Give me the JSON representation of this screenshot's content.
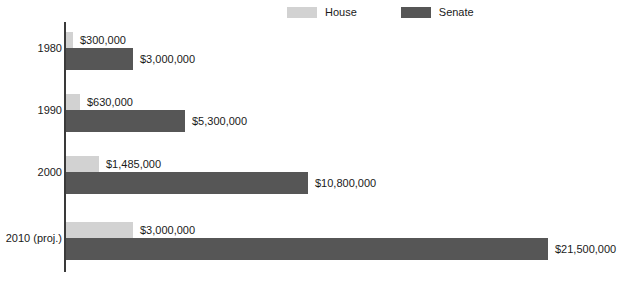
{
  "chart_data": {
    "type": "bar",
    "orientation": "horizontal",
    "title": "",
    "xlabel": "",
    "ylabel": "",
    "grid": false,
    "legend_position": "top-center",
    "xlim": [
      0,
      22000000
    ],
    "categories": [
      "1980",
      "1990",
      "2000",
      "2010 (proj.)"
    ],
    "series": [
      {
        "name": "House",
        "color": "#d2d2d2",
        "values": [
          300000,
          630000,
          1485000,
          3000000
        ],
        "labels": [
          "$300,000",
          "$630,000",
          "$1,485,000",
          "$3,000,000"
        ]
      },
      {
        "name": "Senate",
        "color": "#565656",
        "values": [
          3000000,
          5300000,
          10800000,
          21500000
        ],
        "labels": [
          "$3,000,000",
          "$5,300,000",
          "$10,800,000",
          "$21,500,000"
        ]
      }
    ]
  },
  "legend": {
    "entries": [
      {
        "label": "House",
        "color": "#d2d2d2"
      },
      {
        "label": "Senate",
        "color": "#565656"
      }
    ]
  },
  "axis": {
    "color": "#3a3a3a"
  }
}
